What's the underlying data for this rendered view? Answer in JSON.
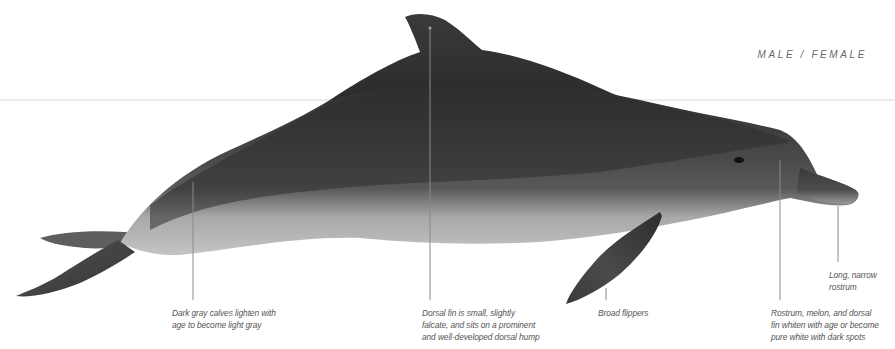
{
  "plate": {
    "subject": "Dolphin side-profile illustration",
    "sex_label": "MALE / FEMALE",
    "colors": {
      "background": "#ffffff",
      "body_dark": "#2f2f2f",
      "body_mid": "#555555",
      "belly_light": "#b9b9b9",
      "leader_line": "#8a8a8a",
      "horizon_line": "#d8d8d8",
      "label_text": "#555555"
    }
  },
  "callouts": [
    {
      "id": "coloration",
      "lines": [
        "Dark gray calves lighten with",
        "age to become light gray"
      ],
      "anchor": {
        "x": 193,
        "y": 182
      },
      "line_end_y": 300
    },
    {
      "id": "dorsal-fin",
      "lines": [
        "Dorsal fin is small, slightly",
        "falcate, and sits on a prominent",
        "and well-developed dorsal hump"
      ],
      "anchor": {
        "x": 430,
        "y": 28
      },
      "line_end_y": 300
    },
    {
      "id": "flippers",
      "lines": [
        "Broad flippers"
      ],
      "anchor": {
        "x": 606,
        "y": 288
      },
      "line_end_y": 300
    },
    {
      "id": "rostrum",
      "lines": [
        "Long, narrow",
        "rostrum"
      ],
      "anchor": {
        "x": 838,
        "y": 206
      },
      "line_end_y": 262
    },
    {
      "id": "whitening",
      "lines": [
        "Rostrum, melon, and dorsal",
        "fin whiten with age or become",
        "pure white with dark spots"
      ],
      "anchor": {
        "x": 780,
        "y": 160
      },
      "line_end_y": 300
    }
  ]
}
